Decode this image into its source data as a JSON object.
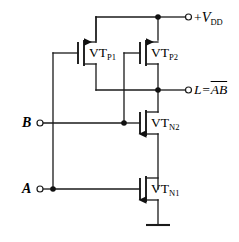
{
  "diagram": {
    "devices": [
      {
        "id": "p1",
        "label_main": "VT",
        "label_sub": "P1",
        "type": "pmos"
      },
      {
        "id": "p2",
        "label_main": "VT",
        "label_sub": "P2",
        "type": "pmos"
      },
      {
        "id": "n2",
        "label_main": "VT",
        "label_sub": "N2",
        "type": "nmos"
      },
      {
        "id": "n1",
        "label_main": "VT",
        "label_sub": "N1",
        "type": "nmos"
      }
    ],
    "terminals": {
      "supply": {
        "sign": "+",
        "symbol": "V",
        "subscript": "DD"
      },
      "output": {
        "name": "L",
        "equals": "=",
        "expr": "AB",
        "overline": true
      },
      "input_b": {
        "label": "B"
      },
      "input_a": {
        "label": "A"
      }
    },
    "ground": {
      "symbol": "ground-bar"
    }
  }
}
